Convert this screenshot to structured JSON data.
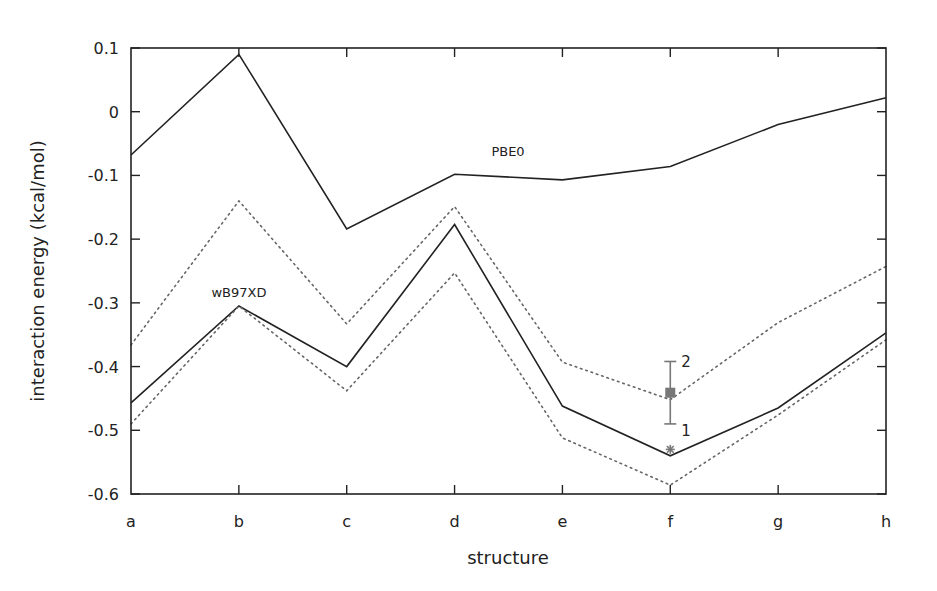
{
  "chart_data": {
    "type": "line",
    "title": "",
    "xlabel": "structure",
    "ylabel": "interaction energy (kcal/mol)",
    "categories": [
      "a",
      "b",
      "c",
      "d",
      "e",
      "f",
      "g",
      "h"
    ],
    "ylim": [
      -0.6,
      0.1
    ],
    "yticks": [
      0.1,
      0,
      -0.1,
      -0.2,
      -0.3,
      -0.4,
      -0.5,
      -0.6
    ],
    "ytick_labels": [
      "0.1",
      "0",
      "-0.1",
      "-0.2",
      "-0.3",
      "-0.4",
      "-0.5",
      "-0.6"
    ],
    "grid": false,
    "legend": "none",
    "series": [
      {
        "name": "PBE0",
        "style": "solid",
        "color": "#222222",
        "values": [
          -0.068,
          0.09,
          -0.184,
          -0.098,
          -0.107,
          -0.086,
          -0.02,
          0.022
        ]
      },
      {
        "name": "wB97XD",
        "style": "solid",
        "color": "#222222",
        "values": [
          -0.457,
          -0.305,
          -0.4,
          -0.177,
          -0.462,
          -0.54,
          -0.465,
          -0.347
        ]
      },
      {
        "name": "wB97XD upper bound",
        "style": "dotted",
        "color": "#666666",
        "values": [
          -0.366,
          -0.14,
          -0.333,
          -0.149,
          -0.393,
          -0.452,
          -0.331,
          -0.243
        ]
      },
      {
        "name": "wB97XD lower bound",
        "style": "dotted",
        "color": "#666666",
        "values": [
          -0.49,
          -0.305,
          -0.438,
          -0.253,
          -0.512,
          -0.586,
          -0.476,
          -0.358
        ]
      }
    ],
    "annotations": [
      {
        "text": "PBE0",
        "x": "e",
        "y": -0.06
      },
      {
        "text": "wB97XD",
        "x": "b",
        "y": -0.28
      }
    ],
    "extra_points": [
      {
        "category": "f",
        "marker": "square",
        "value": -0.441,
        "error_low": -0.49,
        "error_high": -0.392,
        "color": "#777777",
        "labels": [
          {
            "text": "2",
            "at": -0.392
          },
          {
            "text": "1",
            "at": -0.49
          }
        ]
      },
      {
        "category": "f",
        "marker": "star",
        "value": -0.53,
        "color": "#777777"
      }
    ]
  }
}
